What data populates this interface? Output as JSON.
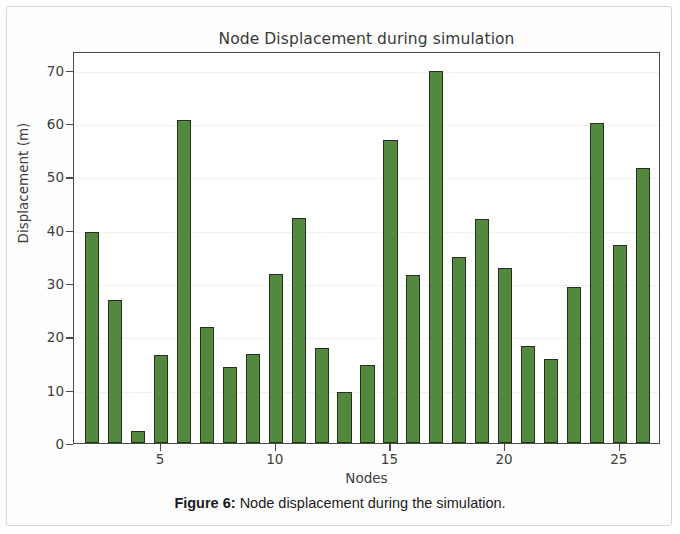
{
  "figure": {
    "caption_label": "Figure 6:",
    "caption_text": "Node displacement during the simulation."
  },
  "chart_data": {
    "type": "bar",
    "title": "Node Displacement during simulation",
    "xlabel": "Nodes",
    "ylabel": "Displacement (m)",
    "grid": true,
    "legend": null,
    "bar_color": "#53893f",
    "bar_edge_color": "#23341b",
    "xlim": [
      1.2,
      26.8
    ],
    "ylim": [
      0,
      73.5
    ],
    "yticks": [
      0,
      10,
      20,
      30,
      40,
      50,
      60,
      70
    ],
    "ytick_labels": [
      "0",
      "10",
      "20",
      "30",
      "40",
      "50",
      "60",
      "70"
    ],
    "xticks": [
      5,
      10,
      15,
      20,
      25
    ],
    "xtick_labels": [
      "5",
      "10",
      "15",
      "20",
      "25"
    ],
    "categories": [
      2,
      3,
      4,
      5,
      6,
      7,
      8,
      9,
      10,
      11,
      12,
      13,
      14,
      15,
      16,
      17,
      18,
      19,
      20,
      21,
      22,
      23,
      24,
      25,
      26
    ],
    "values": [
      39.5,
      26.8,
      2.3,
      16.5,
      60.5,
      21.8,
      14.3,
      16.7,
      31.6,
      42.1,
      17.8,
      9.6,
      14.7,
      56.8,
      31.5,
      69.8,
      34.9,
      42.0,
      32.8,
      18.2,
      15.7,
      29.2,
      60.0,
      37.2,
      51.6
    ]
  }
}
